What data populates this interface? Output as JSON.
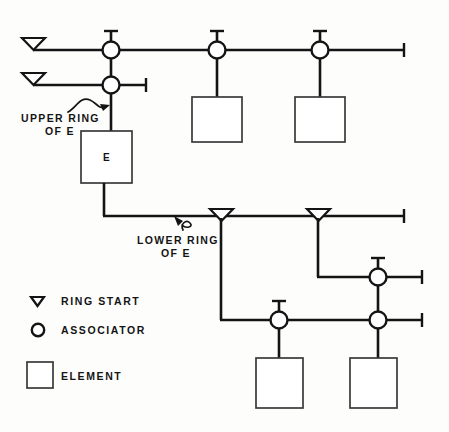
{
  "diagram": {
    "colors": {
      "line": "#141414",
      "box_stroke": "#3a3a3a",
      "background": "#fdfdfc",
      "fill": "#ffffff"
    },
    "annotations": [
      {
        "id": "upper-ring",
        "line1": "UPPER RING",
        "line2": "OF E"
      },
      {
        "id": "lower-ring",
        "line1": "LOWER RING",
        "line2": "OF E"
      }
    ],
    "element_boxes": [
      {
        "id": "element-e",
        "label": "E"
      },
      {
        "id": "element-top-2",
        "label": ""
      },
      {
        "id": "element-top-3",
        "label": ""
      },
      {
        "id": "element-bottom-1",
        "label": ""
      },
      {
        "id": "element-bottom-2",
        "label": ""
      }
    ],
    "legend": {
      "items": [
        {
          "symbol": "ring-start-triangle",
          "label": "RING START"
        },
        {
          "symbol": "associator-circle",
          "label": "ASSOCIATOR"
        },
        {
          "symbol": "element-square",
          "label": "ELEMENT"
        }
      ]
    },
    "nodes": {
      "associators": [
        {
          "id": "assoc-r1-c1",
          "x": 111,
          "y": 50
        },
        {
          "id": "assoc-r1-c2",
          "x": 217,
          "y": 50
        },
        {
          "id": "assoc-r1-c3",
          "x": 320,
          "y": 50
        },
        {
          "id": "assoc-r2-c1",
          "x": 111,
          "y": 85
        },
        {
          "id": "assoc-r3-c1",
          "x": 378,
          "y": 277
        },
        {
          "id": "assoc-r4-c1",
          "x": 279,
          "y": 320
        },
        {
          "id": "assoc-r4-c2",
          "x": 378,
          "y": 320
        }
      ],
      "ring_starts": [
        {
          "id": "ring-start-upper-1",
          "x": 33,
          "y": 44
        },
        {
          "id": "ring-start-upper-2",
          "x": 33,
          "y": 79
        },
        {
          "id": "ring-start-lower-1",
          "x": 221,
          "y": 216
        },
        {
          "id": "ring-start-lower-2",
          "x": 318,
          "y": 216
        }
      ]
    }
  }
}
